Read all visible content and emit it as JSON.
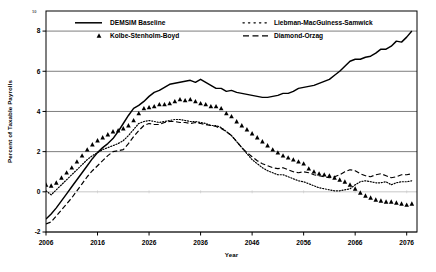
{
  "chart_data": {
    "type": "line",
    "title": "",
    "xlabel": "Year",
    "ylabel": "Percent of Taxable Payrolls",
    "xlim": [
      2006,
      2078
    ],
    "ylim": [
      -2,
      9
    ],
    "grid": true,
    "legend_position": "top",
    "xticks": [
      2006,
      2016,
      2026,
      2036,
      2046,
      2056,
      2066,
      2076
    ],
    "xtick_labels": [
      "2006",
      "2016",
      "2026",
      "2036",
      "2046",
      "2056",
      "2066",
      "2076"
    ],
    "yticks": [
      -2,
      0,
      2,
      4,
      6,
      8
    ],
    "ytick_labels": [
      "-2",
      "0",
      "2",
      "4",
      "6",
      "8"
    ],
    "corner_label": "10",
    "series": [
      {
        "name": "DEMSIM Baseline",
        "style": "solid",
        "marker": "none",
        "color": "#000000",
        "x": [
          2006,
          2007,
          2008,
          2009,
          2010,
          2011,
          2012,
          2013,
          2014,
          2015,
          2016,
          2017,
          2018,
          2019,
          2020,
          2021,
          2022,
          2023,
          2024,
          2025,
          2026,
          2027,
          2028,
          2029,
          2030,
          2031,
          2032,
          2033,
          2034,
          2035,
          2036,
          2037,
          2038,
          2039,
          2040,
          2041,
          2042,
          2043,
          2044,
          2045,
          2046,
          2047,
          2048,
          2049,
          2050,
          2051,
          2052,
          2053,
          2054,
          2055,
          2056,
          2057,
          2058,
          2059,
          2060,
          2061,
          2062,
          2063,
          2064,
          2065,
          2066,
          2067,
          2068,
          2069,
          2070,
          2071,
          2072,
          2073,
          2074,
          2075,
          2076,
          2077
        ],
        "y": [
          -1.35,
          -1.1,
          -0.8,
          -0.45,
          -0.1,
          0.25,
          0.6,
          0.95,
          1.3,
          1.65,
          1.95,
          2.2,
          2.4,
          2.65,
          3.0,
          3.4,
          3.8,
          4.15,
          4.3,
          4.5,
          4.75,
          4.95,
          5.05,
          5.2,
          5.35,
          5.4,
          5.45,
          5.5,
          5.55,
          5.45,
          5.6,
          5.45,
          5.3,
          5.15,
          5.15,
          5.0,
          5.05,
          4.95,
          4.9,
          4.85,
          4.8,
          4.75,
          4.7,
          4.7,
          4.75,
          4.8,
          4.9,
          4.9,
          5.0,
          5.15,
          5.2,
          5.25,
          5.3,
          5.4,
          5.5,
          5.6,
          5.8,
          6.0,
          6.25,
          6.5,
          6.6,
          6.6,
          6.7,
          6.75,
          6.9,
          7.1,
          7.1,
          7.25,
          7.5,
          7.45,
          7.7,
          8.0
        ]
      },
      {
        "name": "Kolbe-Stenholm-Boyd",
        "style": "none",
        "marker": "triangle",
        "color": "#000000",
        "x": [
          2006,
          2007,
          2008,
          2009,
          2010,
          2011,
          2012,
          2013,
          2014,
          2015,
          2016,
          2017,
          2018,
          2019,
          2020,
          2021,
          2022,
          2023,
          2024,
          2025,
          2026,
          2027,
          2028,
          2029,
          2030,
          2031,
          2032,
          2033,
          2034,
          2035,
          2036,
          2037,
          2038,
          2039,
          2040,
          2041,
          2042,
          2043,
          2044,
          2045,
          2046,
          2047,
          2048,
          2049,
          2050,
          2051,
          2052,
          2053,
          2054,
          2055,
          2056,
          2057,
          2058,
          2059,
          2060,
          2061,
          2062,
          2063,
          2064,
          2065,
          2066,
          2067,
          2068,
          2069,
          2070,
          2071,
          2072,
          2073,
          2074,
          2075,
          2076,
          2077
        ],
        "y": [
          0.35,
          0.3,
          0.45,
          0.7,
          0.95,
          1.2,
          1.5,
          1.8,
          2.1,
          2.35,
          2.55,
          2.7,
          2.85,
          3.0,
          3.05,
          3.15,
          3.3,
          3.55,
          3.9,
          4.15,
          4.2,
          4.25,
          4.35,
          4.35,
          4.4,
          4.5,
          4.6,
          4.55,
          4.6,
          4.5,
          4.4,
          4.35,
          4.25,
          4.25,
          4.15,
          3.9,
          3.75,
          3.5,
          3.3,
          3.1,
          2.9,
          2.7,
          2.5,
          2.3,
          2.1,
          1.95,
          1.8,
          1.7,
          1.6,
          1.5,
          1.4,
          1.15,
          1.0,
          0.9,
          0.85,
          0.8,
          0.7,
          0.6,
          0.5,
          0.35,
          0.15,
          -0.05,
          -0.2,
          -0.3,
          -0.4,
          -0.45,
          -0.5,
          -0.5,
          -0.55,
          -0.6,
          -0.65,
          -0.6
        ]
      },
      {
        "name": "Liebman-MacGuiness-Samwick",
        "style": "dotted",
        "marker": "none",
        "color": "#000000",
        "x": [
          2006,
          2007,
          2008,
          2009,
          2010,
          2011,
          2012,
          2013,
          2014,
          2015,
          2016,
          2017,
          2018,
          2019,
          2020,
          2021,
          2022,
          2023,
          2024,
          2025,
          2026,
          2027,
          2028,
          2029,
          2030,
          2031,
          2032,
          2033,
          2034,
          2035,
          2036,
          2037,
          2038,
          2039,
          2040,
          2041,
          2042,
          2043,
          2044,
          2045,
          2046,
          2047,
          2048,
          2049,
          2050,
          2051,
          2052,
          2053,
          2054,
          2055,
          2056,
          2057,
          2058,
          2059,
          2060,
          2061,
          2062,
          2063,
          2064,
          2065,
          2066,
          2067,
          2068,
          2069,
          2070,
          2071,
          2072,
          2073,
          2074,
          2075,
          2076,
          2077
        ],
        "y": [
          0.05,
          -0.15,
          0.1,
          0.35,
          0.6,
          0.85,
          1.1,
          1.35,
          1.6,
          1.8,
          1.95,
          2.1,
          2.2,
          2.3,
          2.4,
          2.55,
          2.8,
          3.1,
          3.4,
          3.5,
          3.55,
          3.5,
          3.45,
          3.5,
          3.55,
          3.6,
          3.6,
          3.55,
          3.5,
          3.5,
          3.45,
          3.4,
          3.3,
          3.3,
          3.2,
          3.0,
          2.8,
          2.5,
          2.2,
          1.9,
          1.6,
          1.4,
          1.2,
          1.05,
          0.95,
          0.85,
          0.85,
          0.75,
          0.65,
          0.55,
          0.5,
          0.4,
          0.3,
          0.2,
          0.15,
          0.1,
          0.05,
          0.05,
          0.1,
          0.15,
          0.35,
          0.5,
          0.55,
          0.5,
          0.45,
          0.45,
          0.5,
          0.35,
          0.45,
          0.5,
          0.5,
          0.55
        ]
      },
      {
        "name": "Diamond-Orzag",
        "style": "dashed",
        "marker": "none",
        "color": "#000000",
        "x": [
          2006,
          2007,
          2008,
          2009,
          2010,
          2011,
          2012,
          2013,
          2014,
          2015,
          2016,
          2017,
          2018,
          2019,
          2020,
          2021,
          2022,
          2023,
          2024,
          2025,
          2026,
          2027,
          2028,
          2029,
          2030,
          2031,
          2032,
          2033,
          2034,
          2035,
          2036,
          2037,
          2038,
          2039,
          2040,
          2041,
          2042,
          2043,
          2044,
          2045,
          2046,
          2047,
          2048,
          2049,
          2050,
          2051,
          2052,
          2053,
          2054,
          2055,
          2056,
          2057,
          2058,
          2059,
          2060,
          2061,
          2062,
          2063,
          2064,
          2065,
          2066,
          2067,
          2068,
          2069,
          2070,
          2071,
          2072,
          2073,
          2074,
          2075,
          2076,
          2077
        ],
        "y": [
          -1.6,
          -1.5,
          -1.2,
          -0.9,
          -0.6,
          -0.3,
          0.05,
          0.4,
          0.75,
          1.05,
          1.3,
          1.55,
          1.8,
          2.0,
          2.05,
          2.1,
          2.4,
          2.75,
          3.05,
          3.3,
          3.4,
          3.35,
          3.35,
          3.45,
          3.5,
          3.5,
          3.45,
          3.45,
          3.4,
          3.45,
          3.4,
          3.35,
          3.3,
          3.25,
          3.15,
          3.0,
          2.8,
          2.5,
          2.2,
          1.95,
          1.75,
          1.55,
          1.4,
          1.3,
          1.2,
          1.15,
          1.2,
          1.1,
          1.0,
          0.95,
          1.0,
          0.95,
          0.85,
          0.8,
          0.75,
          0.7,
          0.75,
          0.85,
          1.0,
          1.1,
          1.05,
          0.9,
          0.8,
          0.75,
          0.85,
          0.9,
          0.8,
          0.7,
          0.75,
          0.85,
          0.85,
          0.9
        ]
      }
    ]
  }
}
